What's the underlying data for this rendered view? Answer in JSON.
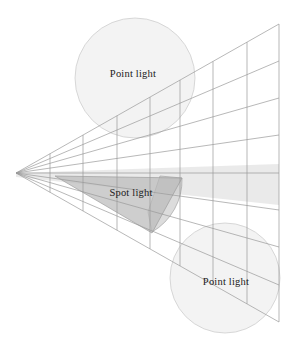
{
  "diagram": {
    "canvas": {
      "width": 295,
      "height": 344,
      "background": "#ffffff"
    },
    "colors": {
      "grid_stroke": "#9a9a9a",
      "circle_fill": "#f1f1f1",
      "circle_stroke": "#c9c9c9",
      "beam_fill": "#d8d8d8",
      "cone_fill": "#b9b9b9",
      "cone_stroke": "#9d9d9d",
      "label_text": "#1a1a1a"
    },
    "frustum": {
      "apex": {
        "x": 16,
        "y": 173
      },
      "far_plane": {
        "top": {
          "x": 279,
          "y": 24
        },
        "bottom": {
          "x": 279,
          "y": 322
        }
      },
      "column_count": 8,
      "row_count": 8,
      "column_x": [
        50,
        83,
        117,
        150,
        180,
        213,
        247,
        279
      ],
      "far_row_y": [
        24,
        61,
        98,
        135,
        173,
        210,
        247,
        285,
        322
      ]
    },
    "labels": [
      {
        "id": "point-light-top",
        "text": "Point light",
        "x": 133,
        "y": 75
      },
      {
        "id": "spot-light",
        "text": "Spot light",
        "x": 131,
        "y": 194
      },
      {
        "id": "point-light-bottom",
        "text": "Point light",
        "x": 226,
        "y": 283
      }
    ],
    "lights": [
      {
        "id": "point-light-top",
        "type": "point",
        "label": "Point light",
        "center": {
          "x": 135,
          "y": 78
        },
        "radius": 60
      },
      {
        "id": "spot-light",
        "type": "spot",
        "label": "Spot light",
        "apex": {
          "x": 55,
          "y": 176
        },
        "cone_far_top": {
          "x": 182,
          "y": 178
        },
        "cone_far_bottom": {
          "x": 155,
          "y": 233
        }
      },
      {
        "id": "point-light-bottom",
        "type": "point",
        "label": "Point light",
        "center": {
          "x": 225,
          "y": 278
        },
        "radius": 55
      }
    ]
  }
}
